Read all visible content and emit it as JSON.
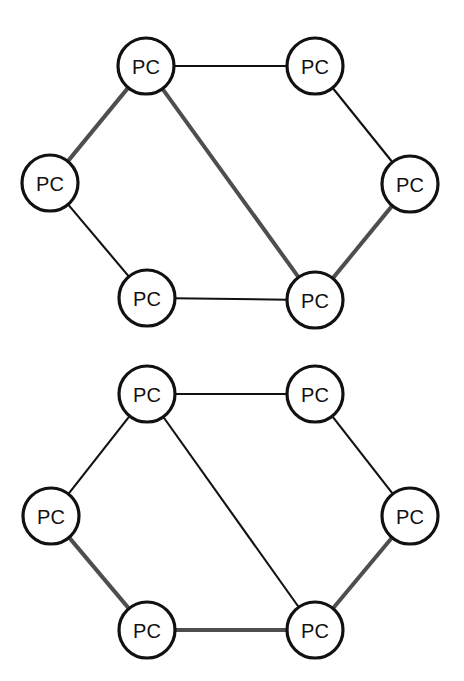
{
  "diagram": {
    "type": "network-topology",
    "title": "",
    "background_color": "#ffffff",
    "node_label": "PC",
    "node_fill": "#ffffff",
    "node_stroke": "#111111",
    "edge_colors": {
      "thin": "#111111",
      "thick": "#4e4e4e"
    },
    "graphs": [
      {
        "id": "top-network",
        "name": "top-ring-network",
        "nodes": [
          {
            "id": "t-topleft",
            "label": "PC",
            "cx": 146,
            "cy": 66,
            "r": 28
          },
          {
            "id": "t-topright",
            "label": "PC",
            "cx": 315,
            "cy": 66,
            "r": 28
          },
          {
            "id": "t-left",
            "label": "PC",
            "cx": 50,
            "cy": 183,
            "r": 28
          },
          {
            "id": "t-right",
            "label": "PC",
            "cx": 410,
            "cy": 184,
            "r": 28
          },
          {
            "id": "t-bottomleft",
            "label": "PC",
            "cx": 147,
            "cy": 298,
            "r": 28
          },
          {
            "id": "t-bottomright",
            "label": "PC",
            "cx": 315,
            "cy": 300,
            "r": 28
          }
        ],
        "edges": [
          {
            "from": "t-topleft",
            "to": "t-topright",
            "style": "thin"
          },
          {
            "from": "t-topleft",
            "to": "t-left",
            "style": "thick"
          },
          {
            "from": "t-topleft",
            "to": "t-bottomright",
            "style": "thick"
          },
          {
            "from": "t-topright",
            "to": "t-right",
            "style": "thin"
          },
          {
            "from": "t-left",
            "to": "t-bottomleft",
            "style": "thin"
          },
          {
            "from": "t-bottomleft",
            "to": "t-bottomright",
            "style": "thin"
          },
          {
            "from": "t-right",
            "to": "t-bottomright",
            "style": "thick"
          }
        ]
      },
      {
        "id": "bottom-network",
        "name": "bottom-ring-network",
        "nodes": [
          {
            "id": "b-topleft",
            "label": "PC",
            "cx": 147,
            "cy": 394,
            "r": 28
          },
          {
            "id": "b-topright",
            "label": "PC",
            "cx": 315,
            "cy": 394,
            "r": 28
          },
          {
            "id": "b-left",
            "label": "PC",
            "cx": 51,
            "cy": 516,
            "r": 28
          },
          {
            "id": "b-right",
            "label": "PC",
            "cx": 410,
            "cy": 516,
            "r": 28
          },
          {
            "id": "b-bottomleft",
            "label": "PC",
            "cx": 147,
            "cy": 630,
            "r": 28
          },
          {
            "id": "b-bottomright",
            "label": "PC",
            "cx": 315,
            "cy": 630,
            "r": 28
          }
        ],
        "edges": [
          {
            "from": "b-topleft",
            "to": "b-topright",
            "style": "thin"
          },
          {
            "from": "b-topleft",
            "to": "b-left",
            "style": "thin"
          },
          {
            "from": "b-topleft",
            "to": "b-bottomright",
            "style": "thin"
          },
          {
            "from": "b-topright",
            "to": "b-right",
            "style": "thin"
          },
          {
            "from": "b-left",
            "to": "b-bottomleft",
            "style": "thick"
          },
          {
            "from": "b-bottomleft",
            "to": "b-bottomright",
            "style": "thick"
          },
          {
            "from": "b-right",
            "to": "b-bottomright",
            "style": "thick"
          }
        ]
      }
    ]
  }
}
